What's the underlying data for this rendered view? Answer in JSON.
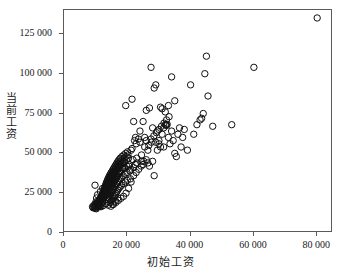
{
  "figure": {
    "top_cropped_text": "",
    "axis_color": "#5a5a5a",
    "marker_color": "#111111",
    "background": "#ffffff"
  },
  "chart_data": {
    "type": "scatter",
    "title": "",
    "xlabel": "初始工资",
    "ylabel": "当前工资",
    "xlim": [
      0,
      85000
    ],
    "ylim": [
      0,
      140000
    ],
    "xticks": [
      0,
      20000,
      40000,
      60000,
      80000
    ],
    "xticklabels": [
      "0",
      "20 000",
      "40 000",
      "60 000",
      "80 000"
    ],
    "yticks": [
      0,
      25000,
      50000,
      75000,
      100000,
      125000
    ],
    "yticklabels": [
      "0",
      "25 000",
      "50 000",
      "75 000",
      "100 000",
      "125 000"
    ],
    "grid": false,
    "legend": null,
    "marker": "open-circle",
    "marker_size": 3.2,
    "points": [
      [
        9000,
        16500
      ],
      [
        9200,
        15800
      ],
      [
        9400,
        17200
      ],
      [
        9600,
        16000
      ],
      [
        9750,
        18000
      ],
      [
        9900,
        15500
      ],
      [
        10000,
        16800
      ],
      [
        10050,
        17500
      ],
      [
        10200,
        15200
      ],
      [
        10350,
        18500
      ],
      [
        10500,
        16200
      ],
      [
        10600,
        19000
      ],
      [
        10700,
        17800
      ],
      [
        10800,
        16500
      ],
      [
        10900,
        20000
      ],
      [
        11000,
        18200
      ],
      [
        11100,
        17000
      ],
      [
        11200,
        21000
      ],
      [
        11300,
        19500
      ],
      [
        11400,
        16800
      ],
      [
        11500,
        22000
      ],
      [
        11600,
        20500
      ],
      [
        11700,
        18000
      ],
      [
        11800,
        23000
      ],
      [
        11900,
        21500
      ],
      [
        12000,
        19000
      ],
      [
        12050,
        24000
      ],
      [
        12100,
        22000
      ],
      [
        12200,
        20000
      ],
      [
        12250,
        25000
      ],
      [
        12300,
        23000
      ],
      [
        12400,
        21000
      ],
      [
        12450,
        26000
      ],
      [
        12500,
        24000
      ],
      [
        12600,
        22500
      ],
      [
        12650,
        27000
      ],
      [
        12700,
        25500
      ],
      [
        12750,
        23500
      ],
      [
        12800,
        28000
      ],
      [
        12900,
        26000
      ],
      [
        12950,
        24500
      ],
      [
        13000,
        29000
      ],
      [
        13050,
        27000
      ],
      [
        13100,
        25000
      ],
      [
        13150,
        30000
      ],
      [
        13200,
        28000
      ],
      [
        13250,
        26000
      ],
      [
        13300,
        31000
      ],
      [
        13400,
        29000
      ],
      [
        13450,
        27000
      ],
      [
        13500,
        32000
      ],
      [
        13550,
        30000
      ],
      [
        13600,
        28000
      ],
      [
        13650,
        24000
      ],
      [
        13700,
        33000
      ],
      [
        13750,
        31000
      ],
      [
        13800,
        29000
      ],
      [
        13850,
        25000
      ],
      [
        13900,
        34000
      ],
      [
        13950,
        32000
      ],
      [
        14000,
        30000
      ],
      [
        14050,
        26000
      ],
      [
        14100,
        22000
      ],
      [
        14150,
        35000
      ],
      [
        14200,
        33000
      ],
      [
        14250,
        31000
      ],
      [
        14300,
        27000
      ],
      [
        14350,
        23000
      ],
      [
        14400,
        36000
      ],
      [
        14450,
        34000
      ],
      [
        14500,
        32000
      ],
      [
        14550,
        28000
      ],
      [
        14600,
        24000
      ],
      [
        14650,
        37000
      ],
      [
        14700,
        35000
      ],
      [
        14750,
        33000
      ],
      [
        14800,
        29000
      ],
      [
        14850,
        25000
      ],
      [
        14900,
        20000
      ],
      [
        14950,
        38000
      ],
      [
        15000,
        36000
      ],
      [
        15050,
        34000
      ],
      [
        15100,
        30000
      ],
      [
        15150,
        26000
      ],
      [
        15200,
        21000
      ],
      [
        15250,
        39000
      ],
      [
        15300,
        37000
      ],
      [
        15350,
        35000
      ],
      [
        15400,
        31000
      ],
      [
        15450,
        27000
      ],
      [
        15500,
        22000
      ],
      [
        15550,
        40000
      ],
      [
        15600,
        38000
      ],
      [
        15650,
        36000
      ],
      [
        15700,
        32000
      ],
      [
        15750,
        28000
      ],
      [
        15800,
        23000
      ],
      [
        15850,
        41000
      ],
      [
        15900,
        39000
      ],
      [
        15950,
        37000
      ],
      [
        16000,
        33000
      ],
      [
        16050,
        29000
      ],
      [
        16100,
        24000
      ],
      [
        16150,
        42000
      ],
      [
        16200,
        40000
      ],
      [
        16250,
        38000
      ],
      [
        16300,
        34000
      ],
      [
        16350,
        30000
      ],
      [
        16400,
        25000
      ],
      [
        16450,
        43000
      ],
      [
        16500,
        41000
      ],
      [
        16550,
        39000
      ],
      [
        16600,
        35000
      ],
      [
        16650,
        31000
      ],
      [
        16700,
        26000
      ],
      [
        16750,
        44000
      ],
      [
        16800,
        42000
      ],
      [
        16850,
        40000
      ],
      [
        16900,
        36000
      ],
      [
        16950,
        32000
      ],
      [
        17000,
        27000
      ],
      [
        17050,
        45000
      ],
      [
        17100,
        43000
      ],
      [
        17200,
        41000
      ],
      [
        17250,
        37000
      ],
      [
        17300,
        33000
      ],
      [
        17350,
        28000
      ],
      [
        17400,
        46000
      ],
      [
        17500,
        44000
      ],
      [
        17550,
        42000
      ],
      [
        17600,
        38000
      ],
      [
        17700,
        34000
      ],
      [
        17750,
        29000
      ],
      [
        17800,
        47000
      ],
      [
        17900,
        45000
      ],
      [
        17950,
        43000
      ],
      [
        18000,
        39000
      ],
      [
        18100,
        35000
      ],
      [
        18200,
        30000
      ],
      [
        18300,
        48000
      ],
      [
        18400,
        46000
      ],
      [
        18500,
        44000
      ],
      [
        18600,
        40000
      ],
      [
        18700,
        36000
      ],
      [
        18800,
        31000
      ],
      [
        18900,
        49000
      ],
      [
        19000,
        47000
      ],
      [
        19100,
        45000
      ],
      [
        19200,
        41000
      ],
      [
        19300,
        37000
      ],
      [
        19400,
        32000
      ],
      [
        19500,
        50000
      ],
      [
        19600,
        48000
      ],
      [
        19700,
        46000
      ],
      [
        19800,
        42000
      ],
      [
        19900,
        38000
      ],
      [
        20000,
        33000
      ],
      [
        20100,
        51000
      ],
      [
        20200,
        49000
      ],
      [
        20400,
        47000
      ],
      [
        20600,
        43000
      ],
      [
        20800,
        39000
      ],
      [
        21000,
        34000
      ],
      [
        21200,
        52000
      ],
      [
        21500,
        53000
      ],
      [
        21800,
        46000
      ],
      [
        22000,
        41000
      ],
      [
        22300,
        58000
      ],
      [
        22600,
        60000
      ],
      [
        22800,
        56000
      ],
      [
        23000,
        44000
      ],
      [
        23500,
        59000
      ],
      [
        24000,
        57000
      ],
      [
        24500,
        45000
      ],
      [
        25000,
        43000
      ],
      [
        25500,
        60000
      ],
      [
        26000,
        46000
      ],
      [
        26500,
        44000
      ],
      [
        27000,
        42000
      ],
      [
        27500,
        59000
      ],
      [
        28000,
        45000
      ],
      [
        28500,
        36000
      ],
      [
        29000,
        57000
      ],
      [
        29500,
        52000
      ],
      [
        30000,
        58000
      ],
      [
        30500,
        54000
      ],
      [
        31000,
        62000
      ],
      [
        31500,
        66000
      ],
      [
        32000,
        68000
      ],
      [
        32200,
        68000
      ],
      [
        32400,
        67500
      ],
      [
        32600,
        68200
      ],
      [
        33000,
        60000
      ],
      [
        33500,
        56000
      ],
      [
        34000,
        64000
      ],
      [
        34500,
        58000
      ],
      [
        35000,
        50000
      ],
      [
        35500,
        48000
      ],
      [
        36000,
        62000
      ],
      [
        36500,
        66000
      ],
      [
        37000,
        54000
      ],
      [
        37500,
        60000
      ],
      [
        38000,
        65000
      ],
      [
        39000,
        52000
      ],
      [
        40000,
        93000
      ],
      [
        41000,
        62000
      ],
      [
        42000,
        68000
      ],
      [
        43000,
        71000
      ],
      [
        43500,
        72000
      ],
      [
        44000,
        75000
      ],
      [
        44500,
        100000
      ],
      [
        45000,
        111000
      ],
      [
        45500,
        86000
      ],
      [
        47000,
        67000
      ],
      [
        53000,
        68000
      ],
      [
        21500,
        84000
      ],
      [
        19500,
        80000
      ],
      [
        22000,
        70000
      ],
      [
        24000,
        64000
      ],
      [
        25000,
        70000
      ],
      [
        26000,
        77000
      ],
      [
        27000,
        78500
      ],
      [
        27500,
        104000
      ],
      [
        28500,
        91000
      ],
      [
        29000,
        93000
      ],
      [
        30500,
        79000
      ],
      [
        31000,
        78000
      ],
      [
        32000,
        76000
      ],
      [
        33000,
        80000
      ],
      [
        34000,
        98000
      ],
      [
        35000,
        83000
      ],
      [
        28000,
        66000
      ],
      [
        29500,
        64000
      ],
      [
        30000,
        56000
      ],
      [
        31500,
        54000
      ],
      [
        26500,
        52000
      ],
      [
        25500,
        54000
      ],
      [
        24500,
        49000
      ],
      [
        23000,
        47000
      ],
      [
        22500,
        43000
      ],
      [
        21000,
        40000
      ],
      [
        20500,
        42000
      ],
      [
        19000,
        44000
      ],
      [
        18500,
        41000
      ],
      [
        17500,
        39000
      ],
      [
        16000,
        38000
      ],
      [
        15000,
        35000
      ],
      [
        14000,
        31000
      ],
      [
        13000,
        27000
      ],
      [
        12000,
        23000
      ],
      [
        11000,
        19000
      ],
      [
        60000,
        104000
      ],
      [
        80000,
        135000
      ],
      [
        10300,
        22000
      ],
      [
        10600,
        24000
      ],
      [
        11500,
        26000
      ],
      [
        12200,
        28000
      ],
      [
        13000,
        23000
      ],
      [
        13800,
        21000
      ],
      [
        14600,
        19000
      ],
      [
        15400,
        18000
      ],
      [
        16200,
        20000
      ],
      [
        17000,
        22000
      ],
      [
        9800,
        30000
      ],
      [
        10100,
        19500
      ],
      [
        10400,
        18200
      ],
      [
        11000,
        17000
      ],
      [
        11700,
        16500
      ],
      [
        12400,
        17200
      ],
      [
        13200,
        18500
      ],
      [
        14000,
        17500
      ],
      [
        14800,
        16800
      ],
      [
        15600,
        17900
      ],
      [
        16400,
        19200
      ],
      [
        17200,
        20500
      ],
      [
        18000,
        21800
      ],
      [
        18800,
        23000
      ],
      [
        19600,
        25000
      ],
      [
        20400,
        28000
      ],
      [
        21200,
        32000
      ],
      [
        22000,
        36000
      ],
      [
        22800,
        38000
      ],
      [
        23600,
        40000
      ],
      [
        24400,
        42000
      ],
      [
        25200,
        45000
      ],
      [
        26000,
        58000
      ],
      [
        26800,
        55000
      ],
      [
        27600,
        57000
      ],
      [
        28400,
        61000
      ],
      [
        29200,
        63000
      ],
      [
        30000,
        65000
      ],
      [
        30800,
        67000
      ],
      [
        31600,
        69000
      ],
      [
        32400,
        71000
      ],
      [
        33200,
        73000
      ]
    ]
  }
}
